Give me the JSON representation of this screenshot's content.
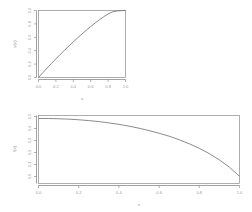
{
  "figure": {
    "background": "#ffffff",
    "line_color": "#6d6d6d",
    "axis_color": "#7a7a7a",
    "text_color": "#9a9a9a",
    "panel_count": 2
  },
  "chart_data": [
    {
      "type": "line",
      "panel": "top",
      "title": "",
      "xlabel": "x",
      "ylabel": "y(x)",
      "xlim": [
        0.0,
        1.0
      ],
      "ylim": [
        0.0,
        1.0
      ],
      "grid": false,
      "legend": null,
      "xticks": [
        "0.0",
        "0.2",
        "0.4",
        "0.6",
        "0.8",
        "1.0"
      ],
      "xtick_values": [
        0.0,
        0.2,
        0.4,
        0.6,
        0.8,
        1.0
      ],
      "yticks": [
        "0.0",
        "0.2",
        "0.4",
        "0.6",
        "0.8",
        "1.0"
      ],
      "ytick_values": [
        0.0,
        0.2,
        0.4,
        0.6,
        0.8,
        1.0
      ],
      "x": [
        0.0,
        0.05,
        0.1,
        0.15,
        0.2,
        0.25,
        0.3,
        0.35,
        0.4,
        0.45,
        0.5,
        0.55,
        0.6,
        0.65,
        0.7,
        0.75,
        0.8,
        0.85,
        0.9,
        0.95,
        1.0
      ],
      "values": [
        0.0,
        0.072,
        0.142,
        0.211,
        0.278,
        0.344,
        0.408,
        0.471,
        0.532,
        0.592,
        0.65,
        0.706,
        0.76,
        0.812,
        0.861,
        0.907,
        0.949,
        0.979,
        0.993,
        0.998,
        1.0
      ]
    },
    {
      "type": "line",
      "panel": "bottom",
      "title": "",
      "xlabel": "x",
      "ylabel": "f(x)",
      "xlim": [
        0.0,
        1.0
      ],
      "ylim": [
        0.4,
        1.55
      ],
      "grid": false,
      "legend": null,
      "xticks": [
        "0.0",
        "0.2",
        "0.4",
        "0.6",
        "0.8",
        "1.0"
      ],
      "xtick_values": [
        0.0,
        0.2,
        0.4,
        0.6,
        0.8,
        1.0
      ],
      "yticks": [
        "1.5",
        "1.4",
        "1.3",
        "1.2",
        "1.1",
        "1.0"
      ],
      "ytick_values": [
        1.5,
        1.4,
        1.3,
        1.2,
        1.1,
        1.0
      ],
      "x": [
        0.0,
        0.05,
        0.1,
        0.15,
        0.2,
        0.25,
        0.3,
        0.35,
        0.4,
        0.45,
        0.5,
        0.55,
        0.6,
        0.65,
        0.7,
        0.75,
        0.8,
        0.85,
        0.9,
        0.95,
        1.0
      ],
      "values": [
        1.5,
        1.499,
        1.495,
        1.488,
        1.478,
        1.464,
        1.447,
        1.425,
        1.4,
        1.37,
        1.335,
        1.295,
        1.25,
        1.2,
        1.14,
        1.072,
        0.995,
        0.905,
        0.8,
        0.675,
        0.52
      ]
    }
  ]
}
